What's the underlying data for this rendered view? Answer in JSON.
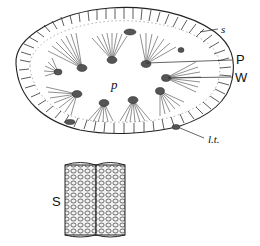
{
  "figure": {
    "type": "biological cross-section illustration",
    "top_panel": {
      "description": "Transverse section of an elongated oval structure with radiating fibre bundles around a central cavity",
      "labels": [
        {
          "id": "s",
          "text": "s",
          "style": "italic-serif"
        },
        {
          "id": "P",
          "text": "P",
          "style": "sans"
        },
        {
          "id": "W",
          "text": "W",
          "style": "sans"
        },
        {
          "id": "p",
          "text": "p",
          "style": "italic-serif"
        },
        {
          "id": "lt",
          "text": "l.t.",
          "style": "italic-serif"
        }
      ]
    },
    "bottom_panel": {
      "description": "Two adjacent cylindrical tubes with reticulated cell-pattern surface",
      "labels": [
        {
          "id": "S",
          "text": "S",
          "style": "sans"
        }
      ]
    },
    "caption": {
      "visible": "cropped, illegible"
    }
  },
  "colors": {
    "ink": "#222222",
    "background": "#ffffff"
  }
}
